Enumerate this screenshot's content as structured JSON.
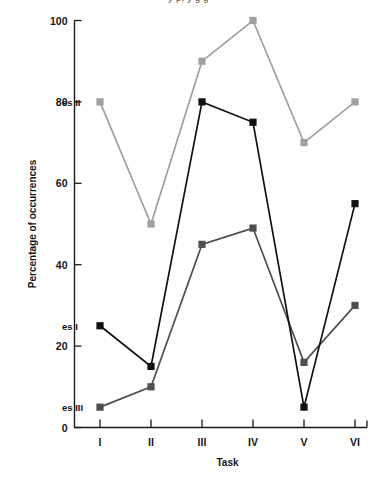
{
  "top_cropped_text": "y p, y g g",
  "chart_data": {
    "type": "line",
    "title": "",
    "xlabel": "Task",
    "ylabel": "Percentage of occurrences",
    "categories": [
      "I",
      "II",
      "III",
      "IV",
      "V",
      "VI"
    ],
    "x_tick_labels": [
      "I",
      "II",
      "III",
      "IV",
      "V",
      "VI"
    ],
    "y_tick_labels": [
      "0",
      "20",
      "40",
      "60",
      "80",
      "100"
    ],
    "y_ticks": [
      0,
      20,
      40,
      60,
      80,
      100
    ],
    "ylim": [
      0,
      100
    ],
    "grid": false,
    "legend_position": "inline-left-of-first-point",
    "marker": "square",
    "series": [
      {
        "name": "es I",
        "label": "es I",
        "color": "#111111",
        "values": [
          25,
          15,
          80,
          75,
          5,
          55
        ],
        "label_position": {
          "x": 1,
          "y": 25
        }
      },
      {
        "name": "es II",
        "label": "es II",
        "color": "#a0a0a0",
        "values": [
          80,
          50,
          90,
          100,
          70,
          80
        ],
        "label_position": {
          "x": 1,
          "y": 80
        }
      },
      {
        "name": "es III",
        "label": "es III",
        "color": "#4f4f4f",
        "values": [
          5,
          10,
          45,
          49,
          16,
          30
        ],
        "label_position": {
          "x": 1,
          "y": 5
        }
      }
    ]
  },
  "colors": {
    "axis": "#1a1a1a",
    "background": "#ffffff",
    "series_1": "#111111",
    "series_2": "#a0a0a0",
    "series_3": "#4f4f4f"
  }
}
